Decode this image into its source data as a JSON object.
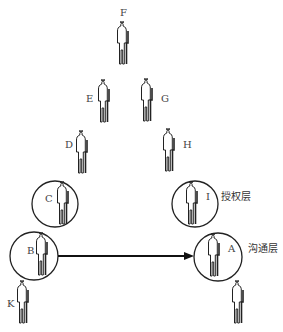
{
  "diagram": {
    "title": "",
    "nodes": [
      {
        "id": "F",
        "label": "F",
        "x": 124,
        "y": 42,
        "circled": false
      },
      {
        "id": "E",
        "label": "E",
        "x": 105,
        "y": 100,
        "circled": false
      },
      {
        "id": "G",
        "label": "G",
        "x": 148,
        "y": 100,
        "circled": false
      },
      {
        "id": "D",
        "label": "D",
        "x": 83,
        "y": 150,
        "circled": false
      },
      {
        "id": "H",
        "label": "H",
        "x": 170,
        "y": 150,
        "circled": false
      },
      {
        "id": "C",
        "label": "C",
        "x": 64,
        "y": 205,
        "circled": true
      },
      {
        "id": "I",
        "label": "I",
        "x": 193,
        "y": 205,
        "circled": true
      },
      {
        "id": "B",
        "label": "B",
        "x": 43,
        "y": 257,
        "circled": true
      },
      {
        "id": "J",
        "label": "J",
        "x": 217,
        "y": 257,
        "circled": true
      },
      {
        "id": "A",
        "label": "A",
        "x": 25,
        "y": 302,
        "circled": false
      },
      {
        "id": "K",
        "label": "K",
        "x": 238,
        "y": 302,
        "circled": false
      }
    ],
    "edges": [
      {
        "from": "B",
        "to": "J",
        "type": "arrow",
        "label": ""
      }
    ],
    "annotations": {
      "authorization_layer": "授权层",
      "communication_layer": "沟通层"
    }
  }
}
